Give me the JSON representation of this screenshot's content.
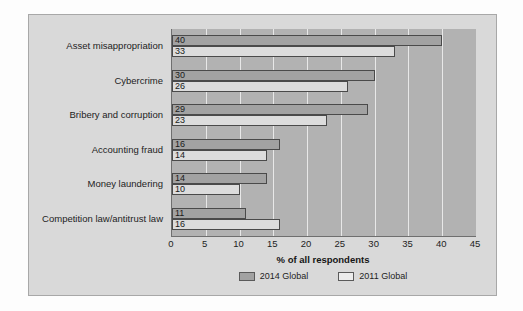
{
  "chart_data": {
    "type": "bar",
    "orientation": "horizontal",
    "title": "",
    "xlabel": "% of all respondents",
    "ylabel": "",
    "xlim": [
      0,
      45
    ],
    "xticks": [
      0,
      5,
      10,
      15,
      20,
      25,
      30,
      35,
      40,
      45
    ],
    "grid": true,
    "legend_position": "bottom",
    "categories": [
      "Asset misappropriation",
      "Cybercrime",
      "Bribery and corruption",
      "Accounting fraud",
      "Money laundering",
      "Competition law/antitrust law"
    ],
    "series": [
      {
        "name": "2014 Global",
        "color": "#a2a2a2",
        "values": [
          40,
          30,
          29,
          16,
          14,
          11
        ]
      },
      {
        "name": "2011 Global",
        "color": "#ececec",
        "values": [
          33,
          26,
          23,
          14,
          10,
          16
        ]
      }
    ],
    "data_labels": {
      "2014 Global": [
        "40",
        "30",
        "29",
        "16",
        "14",
        "11"
      ],
      "2011 Global": [
        "33",
        "26",
        "23",
        "14",
        "10",
        "16"
      ]
    }
  },
  "legend": {
    "items": [
      {
        "label": "2014 Global",
        "swatch": "series-2014-swatch"
      },
      {
        "label": "2011 Global",
        "swatch": "series-2011-swatch"
      }
    ]
  },
  "axis": {
    "x_title": "% of all respondents",
    "tick_labels": [
      "0",
      "5",
      "10",
      "15",
      "20",
      "25",
      "30",
      "35",
      "40",
      "45"
    ]
  },
  "colors": {
    "card_background": "#d9d9d9",
    "plot_background": "#b2b2b2",
    "gridline": "#e8e8e8",
    "series_2014": "#a2a2a2",
    "series_2011": "#ececec",
    "bar_outline": "#4a4a4a",
    "text": "#1d1d1d"
  }
}
